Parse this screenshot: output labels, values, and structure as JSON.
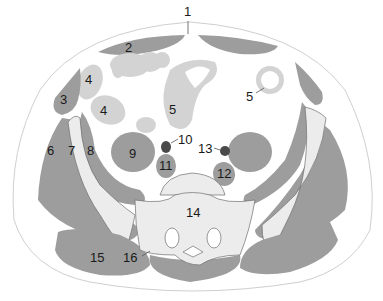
{
  "diagram": {
    "colors": {
      "background": "#ffffff",
      "skin_outline": "#cfcfcf",
      "muscle": "#9d9d9d",
      "bowel": "#d3d3d3",
      "bone": "#ececec",
      "bone_outline": "#6f6f6f",
      "vessel": "#4a4a4a",
      "label": "#1a1a1a"
    },
    "labels": [
      {
        "id": "1",
        "text": "1",
        "x": 188,
        "y": 16
      },
      {
        "id": "2",
        "text": "2",
        "x": 130,
        "y": 52
      },
      {
        "id": "3",
        "text": "3",
        "x": 65,
        "y": 102
      },
      {
        "id": "4a",
        "text": "4",
        "x": 89,
        "y": 82
      },
      {
        "id": "4b",
        "text": "4",
        "x": 104,
        "y": 113
      },
      {
        "id": "5a",
        "text": "5",
        "x": 173,
        "y": 112
      },
      {
        "id": "5b",
        "text": "5",
        "x": 249,
        "y": 100
      },
      {
        "id": "6",
        "text": "6",
        "x": 51,
        "y": 152
      },
      {
        "id": "7",
        "text": "7",
        "x": 72,
        "y": 152
      },
      {
        "id": "8",
        "text": "8",
        "x": 91,
        "y": 152
      },
      {
        "id": "9",
        "text": "9",
        "x": 133,
        "y": 155
      },
      {
        "id": "10",
        "text": "10",
        "x": 186,
        "y": 143
      },
      {
        "id": "11",
        "text": "11",
        "x": 166,
        "y": 168
      },
      {
        "id": "12",
        "text": "12",
        "x": 224,
        "y": 177
      },
      {
        "id": "13",
        "text": "13",
        "x": 205,
        "y": 152
      },
      {
        "id": "14",
        "text": "14",
        "x": 193,
        "y": 216
      },
      {
        "id": "15",
        "text": "15",
        "x": 97,
        "y": 260
      },
      {
        "id": "16",
        "text": "16",
        "x": 131,
        "y": 260
      }
    ]
  }
}
